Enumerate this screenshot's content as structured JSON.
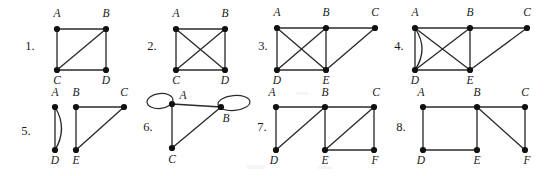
{
  "page": {
    "background_color": "#ffffff",
    "ink_color": "#2b2b2b",
    "vertex_color": "#111111",
    "width": 558,
    "height": 176
  },
  "figures": [
    {
      "number": "1.",
      "number_pos": {
        "x": 30,
        "y": 50
      },
      "vertices": [
        {
          "id": "A",
          "label": "A",
          "x": 57,
          "y": 29,
          "label_x": 57,
          "label_y": 17
        },
        {
          "id": "B",
          "label": "B",
          "x": 106,
          "y": 29,
          "label_x": 106,
          "label_y": 17
        },
        {
          "id": "C",
          "label": "C",
          "x": 57,
          "y": 70,
          "label_x": 57,
          "label_y": 84
        },
        {
          "id": "D",
          "label": "D",
          "x": 106,
          "y": 70,
          "label_x": 106,
          "label_y": 84
        }
      ],
      "edges": [
        {
          "from": "A",
          "to": "B",
          "kind": "straight"
        },
        {
          "from": "A",
          "to": "C",
          "kind": "straight"
        },
        {
          "from": "B",
          "to": "C",
          "kind": "straight"
        },
        {
          "from": "B",
          "to": "D",
          "kind": "straight"
        },
        {
          "from": "C",
          "to": "D",
          "kind": "straight"
        }
      ],
      "loops": []
    },
    {
      "number": "2.",
      "number_pos": {
        "x": 152,
        "y": 50
      },
      "vertices": [
        {
          "id": "A",
          "label": "A",
          "x": 176,
          "y": 29,
          "label_x": 176,
          "label_y": 17
        },
        {
          "id": "B",
          "label": "B",
          "x": 225,
          "y": 29,
          "label_x": 225,
          "label_y": 17
        },
        {
          "id": "C",
          "label": "C",
          "x": 176,
          "y": 70,
          "label_x": 176,
          "label_y": 84
        },
        {
          "id": "D",
          "label": "D",
          "x": 225,
          "y": 70,
          "label_x": 225,
          "label_y": 84
        }
      ],
      "edges": [
        {
          "from": "A",
          "to": "B",
          "kind": "straight"
        },
        {
          "from": "A",
          "to": "C",
          "kind": "straight"
        },
        {
          "from": "A",
          "to": "D",
          "kind": "straight"
        },
        {
          "from": "B",
          "to": "C",
          "kind": "straight"
        },
        {
          "from": "B",
          "to": "D",
          "kind": "straight"
        },
        {
          "from": "C",
          "to": "D",
          "kind": "straight"
        }
      ],
      "loops": []
    },
    {
      "number": "3.",
      "number_pos": {
        "x": 263,
        "y": 50
      },
      "vertices": [
        {
          "id": "A",
          "label": "A",
          "x": 277,
          "y": 28,
          "label_x": 277,
          "label_y": 16
        },
        {
          "id": "B",
          "label": "B",
          "x": 326,
          "y": 28,
          "label_x": 326,
          "label_y": 16
        },
        {
          "id": "C",
          "label": "C",
          "x": 375,
          "y": 28,
          "label_x": 375,
          "label_y": 16
        },
        {
          "id": "D",
          "label": "D",
          "x": 277,
          "y": 70,
          "label_x": 277,
          "label_y": 84
        },
        {
          "id": "E",
          "label": "E",
          "x": 326,
          "y": 70,
          "label_x": 326,
          "label_y": 84
        }
      ],
      "edges": [
        {
          "from": "A",
          "to": "B",
          "kind": "straight"
        },
        {
          "from": "B",
          "to": "C",
          "kind": "straight"
        },
        {
          "from": "A",
          "to": "D",
          "kind": "straight"
        },
        {
          "from": "A",
          "to": "E",
          "kind": "straight"
        },
        {
          "from": "B",
          "to": "D",
          "kind": "straight"
        },
        {
          "from": "B",
          "to": "E",
          "kind": "straight"
        },
        {
          "from": "C",
          "to": "E",
          "kind": "straight"
        },
        {
          "from": "D",
          "to": "E",
          "kind": "straight"
        }
      ],
      "loops": []
    },
    {
      "number": "4.",
      "number_pos": {
        "x": 399,
        "y": 50
      },
      "vertices": [
        {
          "id": "A",
          "label": "A",
          "x": 415,
          "y": 28,
          "label_x": 415,
          "label_y": 16
        },
        {
          "id": "B",
          "label": "B",
          "x": 470,
          "y": 28,
          "label_x": 470,
          "label_y": 16
        },
        {
          "id": "C",
          "label": "C",
          "x": 527,
          "y": 28,
          "label_x": 527,
          "label_y": 16
        },
        {
          "id": "D",
          "label": "D",
          "x": 415,
          "y": 70,
          "label_x": 415,
          "label_y": 84
        },
        {
          "id": "E",
          "label": "E",
          "x": 470,
          "y": 70,
          "label_x": 470,
          "label_y": 84
        }
      ],
      "edges": [
        {
          "from": "A",
          "to": "B",
          "kind": "straight"
        },
        {
          "from": "B",
          "to": "C",
          "kind": "straight"
        },
        {
          "from": "A",
          "to": "D",
          "kind": "straight"
        },
        {
          "from": "A",
          "to": "D",
          "kind": "curved",
          "bulge": -14
        },
        {
          "from": "A",
          "to": "E",
          "kind": "straight"
        },
        {
          "from": "B",
          "to": "D",
          "kind": "straight"
        },
        {
          "from": "B",
          "to": "E",
          "kind": "straight"
        },
        {
          "from": "C",
          "to": "E",
          "kind": "straight"
        },
        {
          "from": "D",
          "to": "E",
          "kind": "straight"
        }
      ],
      "loops": []
    },
    {
      "number": "5.",
      "number_pos": {
        "x": 26,
        "y": 135
      },
      "vertices": [
        {
          "id": "A",
          "label": "A",
          "x": 55,
          "y": 107,
          "label_x": 55,
          "label_y": 96
        },
        {
          "id": "B",
          "label": "B",
          "x": 76,
          "y": 107,
          "label_x": 76,
          "label_y": 96
        },
        {
          "id": "C",
          "label": "C",
          "x": 124,
          "y": 107,
          "label_x": 124,
          "label_y": 96
        },
        {
          "id": "D",
          "label": "D",
          "x": 55,
          "y": 150,
          "label_x": 55,
          "label_y": 164
        },
        {
          "id": "E",
          "label": "E",
          "x": 76,
          "y": 150,
          "label_x": 76,
          "label_y": 164
        }
      ],
      "edges": [
        {
          "from": "A",
          "to": "D",
          "kind": "straight"
        },
        {
          "from": "A",
          "to": "D",
          "kind": "curved",
          "bulge": -13
        },
        {
          "from": "B",
          "to": "C",
          "kind": "straight"
        },
        {
          "from": "B",
          "to": "E",
          "kind": "straight"
        },
        {
          "from": "C",
          "to": "E",
          "kind": "straight"
        }
      ],
      "loops": []
    },
    {
      "number": "6.",
      "number_pos": {
        "x": 148,
        "y": 131
      },
      "vertices": [
        {
          "id": "A",
          "label": "A",
          "x": 172,
          "y": 104,
          "label_x": 183,
          "label_y": 99
        },
        {
          "id": "B",
          "label": "B",
          "x": 221,
          "y": 107,
          "label_x": 226,
          "label_y": 122
        },
        {
          "id": "C",
          "label": "C",
          "x": 172,
          "y": 148,
          "label_x": 172,
          "label_y": 163
        }
      ],
      "edges": [
        {
          "from": "A",
          "to": "B",
          "kind": "straight"
        },
        {
          "from": "A",
          "to": "C",
          "kind": "straight"
        },
        {
          "from": "B",
          "to": "C",
          "kind": "straight"
        }
      ],
      "loops": [
        {
          "at": "A",
          "cx": 160,
          "cy": 101,
          "rx": 13,
          "ry": 7.5,
          "rotate": -6
        },
        {
          "at": "B",
          "cx": 234,
          "cy": 103,
          "rx": 16,
          "ry": 7.5,
          "rotate": -5
        }
      ]
    },
    {
      "number": "7.",
      "number_pos": {
        "x": 262,
        "y": 131
      },
      "vertices": [
        {
          "id": "A",
          "label": "A",
          "x": 276,
          "y": 107,
          "label_x": 272,
          "label_y": 96
        },
        {
          "id": "B",
          "label": "B",
          "x": 325,
          "y": 107,
          "label_x": 325,
          "label_y": 96
        },
        {
          "id": "C",
          "label": "C",
          "x": 374,
          "y": 107,
          "label_x": 376,
          "label_y": 96
        },
        {
          "id": "D",
          "label": "D",
          "x": 276,
          "y": 150,
          "label_x": 274,
          "label_y": 164
        },
        {
          "id": "E",
          "label": "E",
          "x": 325,
          "y": 150,
          "label_x": 325,
          "label_y": 164
        },
        {
          "id": "F",
          "label": "F",
          "x": 374,
          "y": 150,
          "label_x": 375,
          "label_y": 164
        }
      ],
      "edges": [
        {
          "from": "A",
          "to": "B",
          "kind": "straight"
        },
        {
          "from": "B",
          "to": "C",
          "kind": "straight"
        },
        {
          "from": "A",
          "to": "D",
          "kind": "straight"
        },
        {
          "from": "B",
          "to": "D",
          "kind": "straight"
        },
        {
          "from": "B",
          "to": "E",
          "kind": "straight"
        },
        {
          "from": "C",
          "to": "E",
          "kind": "straight"
        },
        {
          "from": "C",
          "to": "F",
          "kind": "straight"
        },
        {
          "from": "E",
          "to": "F",
          "kind": "straight"
        }
      ],
      "loops": []
    },
    {
      "number": "8.",
      "number_pos": {
        "x": 401,
        "y": 131
      },
      "vertices": [
        {
          "id": "A",
          "label": "A",
          "x": 423,
          "y": 107,
          "label_x": 421,
          "label_y": 96
        },
        {
          "id": "B",
          "label": "B",
          "x": 477,
          "y": 107,
          "label_x": 477,
          "label_y": 96
        },
        {
          "id": "C",
          "label": "C",
          "x": 525,
          "y": 107,
          "label_x": 525,
          "label_y": 96
        },
        {
          "id": "D",
          "label": "D",
          "x": 423,
          "y": 150,
          "label_x": 421,
          "label_y": 164
        },
        {
          "id": "E",
          "label": "E",
          "x": 477,
          "y": 150,
          "label_x": 477,
          "label_y": 164
        },
        {
          "id": "F",
          "label": "F",
          "x": 525,
          "y": 150,
          "label_x": 527,
          "label_y": 164
        }
      ],
      "edges": [
        {
          "from": "A",
          "to": "B",
          "kind": "straight"
        },
        {
          "from": "B",
          "to": "C",
          "kind": "straight"
        },
        {
          "from": "A",
          "to": "D",
          "kind": "straight"
        },
        {
          "from": "B",
          "to": "E",
          "kind": "straight"
        },
        {
          "from": "B",
          "to": "F",
          "kind": "straight"
        },
        {
          "from": "C",
          "to": "F",
          "kind": "straight"
        },
        {
          "from": "D",
          "to": "E",
          "kind": "straight"
        }
      ],
      "loops": []
    }
  ],
  "artifacts": [
    {
      "x": 247,
      "y": 165,
      "width": 18,
      "height": 4
    },
    {
      "x": 318,
      "y": 166,
      "width": 14,
      "height": 3
    },
    {
      "x": 296,
      "y": 92,
      "width": 12,
      "height": 3
    }
  ]
}
